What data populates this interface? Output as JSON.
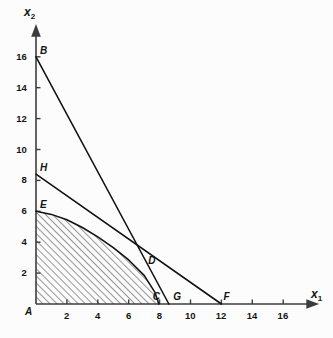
{
  "chart_data": {
    "type": "line",
    "title": "",
    "xlabel": "x1",
    "ylabel": "x2",
    "xlim": [
      0,
      17.6
    ],
    "ylim": [
      0,
      17.4
    ],
    "grid": false,
    "legend": null,
    "xticks": [
      2,
      4,
      6,
      8,
      10,
      12,
      14,
      16
    ],
    "xtick_labels": [
      "2",
      "4",
      "6",
      "8",
      "10",
      "12",
      "14",
      "16"
    ],
    "yticks": [
      2,
      4,
      6,
      8,
      10,
      12,
      14,
      16
    ],
    "ytick_labels": [
      "2",
      "4",
      "6",
      "8",
      "10",
      "12",
      "14",
      "16"
    ],
    "series": [
      {
        "name": "BG",
        "type": "line",
        "from_label": "B",
        "to_label": "G",
        "points": [
          [
            0,
            16
          ],
          [
            8.6,
            0
          ]
        ]
      },
      {
        "name": "HF",
        "type": "line",
        "from_label": "H",
        "to_label": "F",
        "points": [
          [
            0,
            8.4
          ],
          [
            12,
            0
          ]
        ]
      },
      {
        "name": "EC",
        "type": "curve",
        "from_label": "E",
        "to_label": "C",
        "points": [
          [
            0,
            6
          ],
          [
            1,
            5.8
          ],
          [
            2,
            5.45
          ],
          [
            3,
            4.95
          ],
          [
            4,
            4.35
          ],
          [
            5,
            3.65
          ],
          [
            6,
            2.85
          ],
          [
            7,
            1.85
          ],
          [
            7.7,
            0.75
          ],
          [
            7.95,
            0
          ]
        ]
      }
    ],
    "shaded_region": {
      "name": "feasible-region",
      "hatch": "///",
      "vertices_note": "A(0,0) - E(0,6) - curve - C(7.95,0)"
    },
    "point_labels": [
      {
        "label": "A",
        "x": 0,
        "y": 0,
        "dx": -11,
        "dy": 3
      },
      {
        "label": "B",
        "x": 0,
        "y": 16,
        "dx": 4,
        "dy": -11
      },
      {
        "label": "C",
        "x": 7.55,
        "y": 0,
        "dx": 0,
        "dy": -12
      },
      {
        "label": "D",
        "x": 7.0,
        "y": 2.9,
        "dx": 4,
        "dy": -3
      },
      {
        "label": "E",
        "x": 0,
        "y": 6,
        "dx": 4,
        "dy": -11
      },
      {
        "label": "F",
        "x": 12,
        "y": 0,
        "dx": 2,
        "dy": -12
      },
      {
        "label": "G",
        "x": 8.75,
        "y": 0,
        "dx": 2,
        "dy": -12
      },
      {
        "label": "H",
        "x": 0,
        "y": 8.4,
        "dx": 4,
        "dy": -11
      }
    ],
    "colors": {
      "background": "#fcfcfc",
      "axis": "#3c3c3c",
      "line": "#111111",
      "hatch": "#555555",
      "text": "#141414"
    }
  }
}
